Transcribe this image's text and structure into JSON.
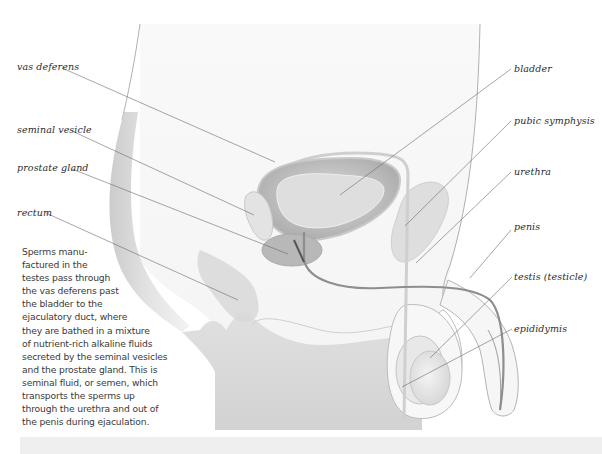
{
  "diagram": {
    "labels": {
      "vas_deferens": "vas deferens",
      "seminal_vesicle": "seminal vesicle",
      "prostate_gland": "prostate gland",
      "rectum": "rectum",
      "bladder": "bladder",
      "pubic_symphysis": "pubic symphysis",
      "urethra": "urethra",
      "penis": "penis",
      "testis": "testis (testicle)",
      "epididymis": "epididymis"
    },
    "caption_lines": [
      "Sperms manu-",
      "factured in the",
      "testes pass through",
      "the vas deferens past",
      "the bladder to the",
      "ejaculatory duct, where",
      "they are bathed in a mixture",
      "of nutrient-rich alkaline fluids",
      "secreted by the seminal vesicles",
      "and the prostate gland. This is",
      "seminal fluid, or semen, which",
      "transports the sperms up",
      "through the urethra and out of",
      "the penis during ejaculation."
    ]
  }
}
